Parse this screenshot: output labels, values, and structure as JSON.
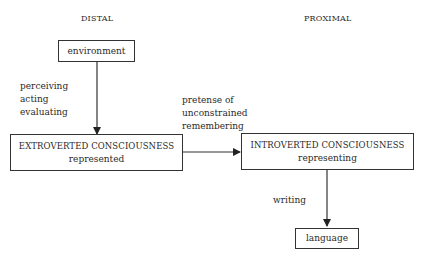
{
  "headings": {
    "left": "DISTAL",
    "right": "PROXIMAL"
  },
  "nodes": {
    "environment": {
      "label": "environment"
    },
    "extroverted": {
      "title": "EXTROVERTED CONSCIOUSNESS",
      "subtitle": "represented"
    },
    "introverted": {
      "title": "INTROVERTED CONSCIOUSNESS",
      "subtitle": "representing"
    },
    "language": {
      "label": "language"
    }
  },
  "edges": {
    "environment_to_extroverted": {
      "lines": [
        "perceiving",
        "acting",
        "evaluating"
      ]
    },
    "extroverted_to_introverted": {
      "lines": [
        "pretense of",
        "unconstrained",
        "remembering"
      ]
    },
    "introverted_to_language": {
      "lines": [
        "writing"
      ]
    }
  },
  "colors": {
    "stroke": "#333333",
    "text": "#2a2a2a",
    "background": "#ffffff"
  }
}
